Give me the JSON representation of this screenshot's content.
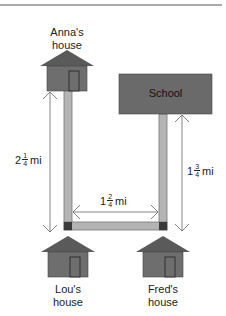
{
  "diagram": {
    "places": {
      "anna": {
        "line1": "Anna's",
        "line2": "house"
      },
      "school": {
        "label": "School"
      },
      "lou": {
        "line1": "Lou's",
        "line2": "house"
      },
      "fred": {
        "line1": "Fred's",
        "line2": "house"
      }
    },
    "distances": {
      "anna_to_lou": {
        "whole": "2",
        "num": "1",
        "den": "4",
        "unit": "mi"
      },
      "lou_to_fred": {
        "whole": "1",
        "num": "2",
        "den": "4",
        "unit": "mi"
      },
      "fred_to_school": {
        "whole": "1",
        "num": "3",
        "den": "4",
        "unit": "mi"
      }
    },
    "colors": {
      "house": "#6e6e6e",
      "roof": "#5a5a5a",
      "road": "#b4b4b4",
      "road_edge": "#777777",
      "school": "#6a6a6a",
      "arrow": "#666666",
      "rule": "#555555"
    }
  }
}
